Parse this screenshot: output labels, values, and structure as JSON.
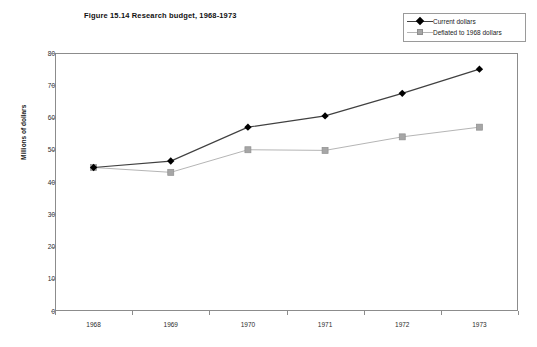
{
  "chart_data": {
    "type": "line",
    "title": "Figure 15.14 Research budget, 1968-1973",
    "xlabel": "",
    "ylabel": "Millions of dollars",
    "categories": [
      "1968",
      "1969",
      "1970",
      "1971",
      "1972",
      "1973"
    ],
    "x": [
      1968,
      1969,
      1970,
      1971,
      1972,
      1973
    ],
    "series": [
      {
        "name": "Current dollars",
        "values": [
          44.5,
          46.5,
          57.0,
          60.5,
          67.5,
          75.0
        ],
        "color": "#404040",
        "marker": "diamond",
        "marker_color": "#000000"
      },
      {
        "name": "Deflated to 1968 dollars",
        "values": [
          44.5,
          43.0,
          50.0,
          49.8,
          54.0,
          57.0
        ],
        "color": "#b5b5b5",
        "marker": "square",
        "marker_color": "#a6a6a6"
      }
    ],
    "ylim": [
      0,
      80
    ],
    "yticks": [
      0,
      10,
      20,
      30,
      40,
      50,
      60,
      70,
      80
    ],
    "ytick_labels": [
      "0",
      "10",
      "20",
      "30",
      "40",
      "50",
      "60",
      "70",
      "80"
    ],
    "grid": false,
    "legend_position": "top-right",
    "axis_color": "#8c8c8c",
    "background": "#ffffff"
  },
  "legend": {
    "entries": [
      {
        "label": "Current dollars"
      },
      {
        "label": "Deflated to 1968 dollars"
      }
    ]
  }
}
